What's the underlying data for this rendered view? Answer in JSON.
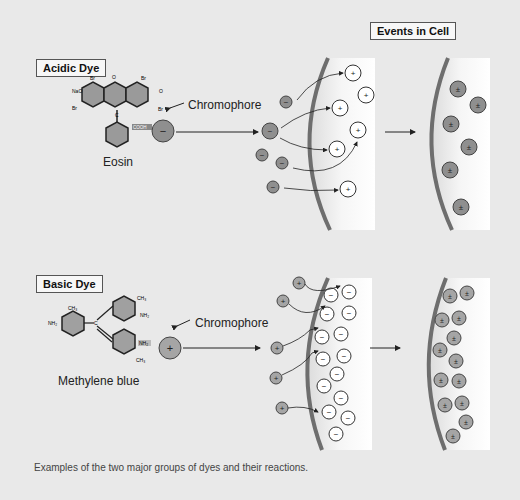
{
  "header": {
    "events_label": "Events in Cell"
  },
  "acidic": {
    "label": "Acidic Dye",
    "molecule_name": "Eosin",
    "chromophore_label": "Chromophore",
    "group_label": "COOH",
    "atoms": {
      "nao": "NaO",
      "br": "Br",
      "o": "O",
      "c": "C"
    },
    "dye_charge": "−",
    "cell_charge": "+",
    "result_charge": "±",
    "colors": {
      "dye": "#8f8f8f",
      "cell": "#ffffff",
      "membrane": "#6e6e6e"
    }
  },
  "basic": {
    "label": "Basic Dye",
    "molecule_name": "Methylene blue",
    "chromophore_label": "Chromophore",
    "atoms": {
      "nh2": "NH₂",
      "ch3": "CH₃",
      "c": "C"
    },
    "dye_charge": "+",
    "cell_charge": "−",
    "result_charge": "±",
    "colors": {
      "dye": "#a5a5a5",
      "cell": "#ffffff",
      "membrane": "#6e6e6e"
    }
  },
  "caption": "Examples of the two major groups of dyes and their reactions."
}
